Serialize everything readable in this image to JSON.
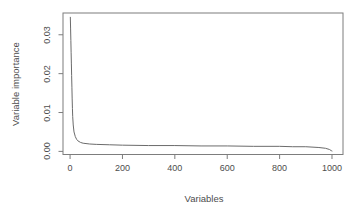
{
  "figure": {
    "background": "#ffffff",
    "axis_line_color": "#7d7d7d",
    "curve_color": "#6b6b6b",
    "text_color": "#4d4d4d"
  },
  "chart_data": {
    "type": "line",
    "title": "",
    "xlabel": "Variables",
    "ylabel": "Variable importance",
    "grid": false,
    "legend": "none",
    "xlim": [
      -27,
      1042
    ],
    "ylim": [
      -0.0008,
      0.0356
    ],
    "xticks": [
      {
        "value": 0,
        "label": "0"
      },
      {
        "value": 200,
        "label": "200"
      },
      {
        "value": 400,
        "label": "400"
      },
      {
        "value": 600,
        "label": "600"
      },
      {
        "value": 800,
        "label": "800"
      },
      {
        "value": 1000,
        "label": "1000"
      }
    ],
    "yticks": [
      {
        "value": 0.0,
        "label": "0.00"
      },
      {
        "value": 0.01,
        "label": "0.01"
      },
      {
        "value": 0.02,
        "label": "0.02"
      },
      {
        "value": 0.03,
        "label": "0.03"
      }
    ],
    "series": [
      {
        "name": "sorted-variable-importance",
        "points": [
          [
            1,
            0.0345
          ],
          [
            2,
            0.0315
          ],
          [
            3,
            0.0285
          ],
          [
            4,
            0.0255
          ],
          [
            5,
            0.0225
          ],
          [
            6,
            0.0195
          ],
          [
            7,
            0.0165
          ],
          [
            8,
            0.0135
          ],
          [
            9,
            0.011
          ],
          [
            10,
            0.009
          ],
          [
            12,
            0.0068
          ],
          [
            15,
            0.005
          ],
          [
            20,
            0.0038
          ],
          [
            25,
            0.0031
          ],
          [
            30,
            0.0027
          ],
          [
            40,
            0.0023
          ],
          [
            50,
            0.0021
          ],
          [
            75,
            0.0019
          ],
          [
            100,
            0.0018
          ],
          [
            150,
            0.0017
          ],
          [
            200,
            0.0016
          ],
          [
            300,
            0.0015
          ],
          [
            400,
            0.0015
          ],
          [
            500,
            0.0014
          ],
          [
            600,
            0.0014
          ],
          [
            700,
            0.0013
          ],
          [
            800,
            0.0013
          ],
          [
            850,
            0.0012
          ],
          [
            900,
            0.0012
          ],
          [
            950,
            0.001
          ],
          [
            975,
            0.0008
          ],
          [
            990,
            0.0005
          ],
          [
            997,
            0.0002
          ],
          [
            1000,
            0.0001
          ]
        ]
      }
    ]
  }
}
